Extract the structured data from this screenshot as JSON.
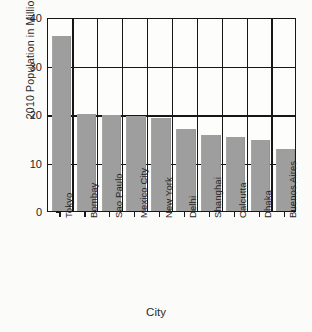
{
  "chart_data": {
    "type": "bar",
    "title": "",
    "xlabel": "City",
    "ylabel": "2010 Population in Millions",
    "categories": [
      "Tokyo",
      "Bombay",
      "Sao Paulo",
      "Mexico City",
      "New York",
      "Delhi",
      "Shanghai",
      "Calcutta",
      "Dhaka",
      "Buenos Aires"
    ],
    "values": [
      36.0,
      20.0,
      19.8,
      19.6,
      19.2,
      17.0,
      15.6,
      15.2,
      14.6,
      12.8
    ],
    "ylim": [
      0,
      40
    ],
    "yticks": [
      0,
      10,
      20,
      30,
      40
    ],
    "ytick_labels": [
      "0",
      "10",
      "20",
      "30",
      "40"
    ],
    "grid": "horizontal-and-vertical",
    "legend": "none",
    "bar_color": "#9e9e9e",
    "axis_color": "#161616",
    "background": "#fbfbfa"
  },
  "axis": {
    "y_title": "2010 Population in Millions",
    "x_title": "City"
  }
}
